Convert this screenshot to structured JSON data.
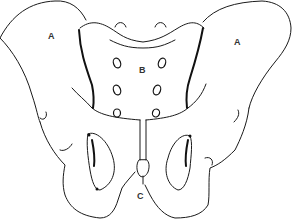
{
  "diagram": {
    "view": "posterior",
    "labels": {
      "left_hip": "A",
      "right_hip": "A",
      "sacrum": "B",
      "coccyx": "C"
    },
    "colors": {
      "line": "#1a1a1a",
      "label": "#333333",
      "background": "#ffffff"
    }
  }
}
